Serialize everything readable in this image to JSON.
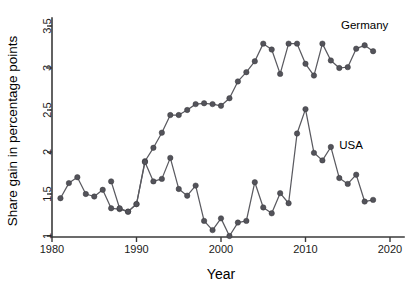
{
  "chart_data": {
    "type": "line",
    "title": "",
    "xlabel": "Year",
    "ylabel": "Share gain in percentage points",
    "xlim": [
      1979,
      2021
    ],
    "ylim": [
      0.95,
      3.6
    ],
    "xticks": [
      1980,
      1990,
      2000,
      2010,
      2020
    ],
    "xticklabels": [
      "1980",
      "1990",
      "2000",
      "2010",
      "2020"
    ],
    "yticks": [
      1,
      1.5,
      2,
      2.5,
      3,
      3.5
    ],
    "yticklabels": [
      "1",
      "1.5",
      "2",
      "2.5",
      "3",
      "3.5"
    ],
    "grid": false,
    "legend_position": "inline-annotation",
    "marker": "circle",
    "series": [
      {
        "name": "Germany",
        "annotation": "Germany",
        "annotation_x": 2014.2,
        "annotation_y": 3.46,
        "color": "#53535a",
        "x": [
          1981,
          1982,
          1983,
          1984,
          1985,
          1986,
          1987,
          1988,
          1989,
          1990,
          1991,
          1992,
          1993,
          1994,
          1995,
          1996,
          1997,
          1998,
          1999,
          2000,
          2001,
          2002,
          2003,
          2004,
          2005,
          2006,
          2007,
          2008,
          2009,
          2010,
          2011,
          2012,
          2013,
          2014,
          2015,
          2016,
          2017,
          2018
        ],
        "values": [
          1.45,
          1.63,
          1.7,
          1.5,
          1.47,
          1.55,
          1.33,
          1.32,
          1.29,
          1.38,
          1.89,
          2.05,
          2.23,
          2.44,
          2.44,
          2.5,
          2.57,
          2.58,
          2.57,
          2.55,
          2.64,
          2.84,
          2.95,
          3.08,
          3.29,
          3.22,
          2.93,
          3.29,
          3.29,
          3.05,
          2.91,
          3.29,
          3.09,
          3.0,
          3.01,
          3.23,
          3.27,
          3.2
        ]
      },
      {
        "name": "USA",
        "annotation": "USA",
        "annotation_x": 2014.0,
        "annotation_y": 2.03,
        "color": "#53535a",
        "x": [
          1987,
          1988,
          1989,
          1990,
          1991,
          1992,
          1993,
          1994,
          1995,
          1996,
          1997,
          1998,
          1999,
          2000,
          2001,
          2002,
          2003,
          2004,
          2005,
          2006,
          2007,
          2008,
          2009,
          2010,
          2011,
          2012,
          2013,
          2014,
          2015,
          2016,
          2017,
          2018
        ],
        "values": [
          1.65,
          1.33,
          1.29,
          1.38,
          1.88,
          1.65,
          1.68,
          1.93,
          1.56,
          1.48,
          1.6,
          1.18,
          1.07,
          1.21,
          1.0,
          1.16,
          1.18,
          1.64,
          1.34,
          1.27,
          1.51,
          1.39,
          2.22,
          2.51,
          1.99,
          1.9,
          2.06,
          1.69,
          1.62,
          1.73,
          1.41,
          1.43
        ]
      }
    ]
  }
}
